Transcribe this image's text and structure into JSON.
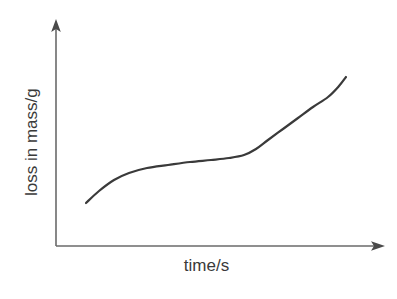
{
  "figure": {
    "background_color": "#ffffff",
    "width": 397,
    "height": 299
  },
  "axes": {
    "line_color": "#6a6a6a",
    "arrow_color": "#4a4a4a",
    "x_axis": {
      "label": "time/s",
      "has_arrowhead": true,
      "ticks": [],
      "tick_labels": []
    },
    "y_axis": {
      "label": "loss in mass/g",
      "has_arrowhead": true,
      "ticks": [],
      "tick_labels": []
    }
  },
  "curve": {
    "color": "#3a3a3a",
    "width_px": 2.2
  },
  "chart_data": {
    "type": "line",
    "title": "",
    "subtitle": "",
    "xlabel": "time/s",
    "ylabel": "loss in mass/g",
    "grid": false,
    "legend": null,
    "legend_position": "none",
    "axis_style": "arrow-axes, unscaled (no tick marks or numeric labels)",
    "xlim": [
      0,
      1
    ],
    "ylim": [
      0,
      1
    ],
    "x_tick_labels": [],
    "y_tick_labels": [],
    "annotations": [],
    "series": [
      {
        "name": "loss in mass",
        "x": [
          0.1,
          0.14,
          0.19,
          0.24,
          0.3,
          0.37,
          0.44,
          0.51,
          0.57,
          0.62,
          0.66,
          0.7,
          0.75,
          0.8,
          0.85,
          0.9,
          0.95,
          1.0
        ],
        "y": [
          0.19,
          0.27,
          0.35,
          0.4,
          0.43,
          0.45,
          0.46,
          0.47,
          0.48,
          0.5,
          0.54,
          0.6,
          0.67,
          0.73,
          0.78,
          0.82,
          0.85,
          0.87
        ],
        "points_pixel": [
          [
            86,
            203
          ],
          [
            99,
            191
          ],
          [
            114,
            180
          ],
          [
            129,
            173
          ],
          [
            147,
            168
          ],
          [
            168,
            165
          ],
          [
            190,
            162
          ],
          [
            211,
            160
          ],
          [
            229,
            158
          ],
          [
            244,
            155
          ],
          [
            256,
            149
          ],
          [
            268,
            140
          ],
          [
            283,
            129
          ],
          [
            298,
            118
          ],
          [
            313,
            107
          ],
          [
            328,
            97
          ],
          [
            339,
            86
          ],
          [
            346,
            77
          ]
        ]
      }
    ]
  }
}
